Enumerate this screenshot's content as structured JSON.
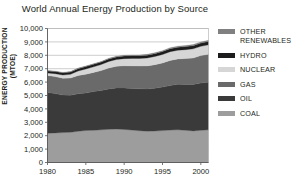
{
  "chart_data": {
    "type": "area",
    "title": "World Annual Energy Production by Source",
    "xlabel": "",
    "ylabel": "ENERGY PRODUCTION (MTOE)",
    "xlim": [
      1980,
      2001
    ],
    "ylim": [
      0,
      10000
    ],
    "grid": true,
    "stacked": true,
    "legend_position": "right",
    "x": [
      1980,
      1981,
      1982,
      1983,
      1984,
      1985,
      1986,
      1987,
      1988,
      1989,
      1990,
      1991,
      1992,
      1993,
      1994,
      1995,
      1996,
      1997,
      1998,
      1999,
      2000,
      2001
    ],
    "xticks": [
      1980,
      1985,
      1990,
      1995,
      2000
    ],
    "xtick_labels": [
      "1980",
      "1985",
      "1990",
      "1995",
      "2000"
    ],
    "yticks": [
      0,
      1000,
      2000,
      3000,
      4000,
      5000,
      6000,
      7000,
      8000,
      9000,
      10000
    ],
    "ytick_labels": [
      "0",
      "1,000",
      "2,000",
      "3,000",
      "4,000",
      "5,000",
      "6,000",
      "7,000",
      "8,000",
      "9,000",
      "10,000"
    ],
    "series": [
      {
        "name": "COAL",
        "color": "#9d9d9d",
        "values": [
          2180,
          2210,
          2230,
          2260,
          2330,
          2390,
          2400,
          2440,
          2480,
          2500,
          2470,
          2420,
          2370,
          2340,
          2350,
          2380,
          2420,
          2440,
          2400,
          2360,
          2400,
          2440
        ]
      },
      {
        "name": "OIL",
        "color": "#3a3a3a",
        "values": [
          3050,
          2930,
          2800,
          2760,
          2800,
          2790,
          2890,
          2930,
          3010,
          3060,
          3090,
          3100,
          3130,
          3140,
          3200,
          3250,
          3320,
          3400,
          3430,
          3470,
          3530,
          3550
        ]
      },
      {
        "name": "GAS",
        "color": "#6a6a6a",
        "values": [
          1260,
          1270,
          1260,
          1280,
          1360,
          1410,
          1430,
          1490,
          1560,
          1620,
          1660,
          1690,
          1700,
          1730,
          1750,
          1800,
          1880,
          1890,
          1930,
          1970,
          2050,
          2090
        ]
      },
      {
        "name": "NUCLEAR",
        "color": "#d6d6d6",
        "values": [
          190,
          220,
          240,
          280,
          340,
          390,
          420,
          450,
          490,
          510,
          530,
          560,
          570,
          590,
          610,
          630,
          650,
          650,
          660,
          680,
          690,
          700
        ]
      },
      {
        "name": "HYDRO",
        "color": "#1c1c1c",
        "values": [
          150,
          155,
          160,
          170,
          175,
          180,
          185,
          185,
          190,
          190,
          195,
          200,
          200,
          210,
          215,
          220,
          225,
          225,
          230,
          235,
          240,
          245
        ]
      },
      {
        "name": "OTHER RENEWABLES",
        "color": "#808080",
        "values": [
          30,
          32,
          34,
          36,
          38,
          40,
          42,
          45,
          48,
          50,
          52,
          55,
          58,
          60,
          63,
          66,
          70,
          74,
          78,
          82,
          86,
          90
        ]
      }
    ],
    "totals": [
      6860,
      6817,
      6724,
      6786,
      7043,
      7200,
      7367,
      7540,
      7778,
      7930,
      7997,
      8025,
      8028,
      8070,
      8188,
      8346,
      8565,
      8679,
      8728,
      8797,
      8996,
      9115
    ]
  },
  "legend": {
    "items": [
      {
        "label": "OTHER\nRENEWABLES",
        "color": "#808080",
        "name": "other-renewables"
      },
      {
        "label": "HYDRO",
        "color": "#1c1c1c",
        "name": "hydro"
      },
      {
        "label": "NUCLEAR",
        "color": "#d6d6d6",
        "name": "nuclear"
      },
      {
        "label": "GAS",
        "color": "#6a6a6a",
        "name": "gas"
      },
      {
        "label": "OIL",
        "color": "#3a3a3a",
        "name": "oil"
      },
      {
        "label": "COAL",
        "color": "#9d9d9d",
        "name": "coal"
      }
    ]
  },
  "axes": {
    "grid_color": "#b8b8b8",
    "axis_color": "#555555",
    "text_color": "#231f20"
  }
}
